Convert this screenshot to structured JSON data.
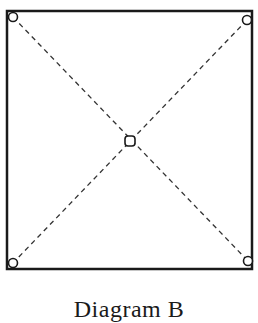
{
  "caption": "Diagram B",
  "colors": {
    "stroke": "#1a1a1a",
    "background": "#ffffff"
  },
  "square": {
    "x": 7,
    "y": 11,
    "width": 245,
    "height": 258
  },
  "corner_nodes": [
    {
      "name": "top-left",
      "cx": 13,
      "cy": 17
    },
    {
      "name": "top-right",
      "cx": 247,
      "cy": 20
    },
    {
      "name": "bottom-left",
      "cx": 13,
      "cy": 263
    },
    {
      "name": "bottom-right",
      "cx": 248,
      "cy": 261
    }
  ],
  "center_node": {
    "cx": 130,
    "cy": 141
  }
}
